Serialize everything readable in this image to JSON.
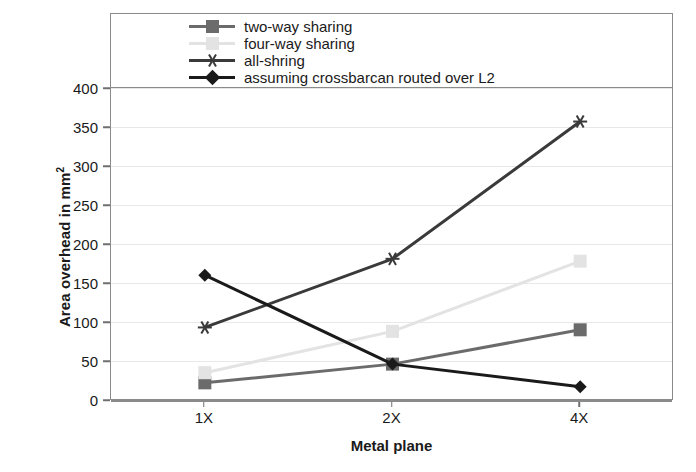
{
  "chart_data": {
    "type": "line",
    "title": "",
    "xlabel": "Metal plane",
    "ylabel_text": "Area overhead in mm",
    "ylabel_sup": "2",
    "categories": [
      "1X",
      "2X",
      "4X"
    ],
    "ylim": [
      0,
      400
    ],
    "ytick_labels": [
      "400",
      "350",
      "300",
      "250",
      "200",
      "150",
      "100",
      "50",
      "0"
    ],
    "ytick_values": [
      400,
      350,
      300,
      250,
      200,
      150,
      100,
      50,
      0
    ],
    "grid": true,
    "legend_position": "top-inside",
    "series": [
      {
        "name": "two-way sharing",
        "values": [
          22,
          46,
          90
        ],
        "color": "#6b6b6b",
        "marker": "square"
      },
      {
        "name": "four-way sharing",
        "values": [
          35,
          88,
          178
        ],
        "color": "#e3e3e3",
        "marker": "square"
      },
      {
        "name": "all-shring",
        "values": [
          93,
          181,
          357
        ],
        "color": "#3a3a3a",
        "marker": "star"
      },
      {
        "name": "assuming crossbarcan routed over L2",
        "values": [
          160,
          46,
          17
        ],
        "color": "#1a1a1a",
        "marker": "diamond"
      }
    ]
  }
}
